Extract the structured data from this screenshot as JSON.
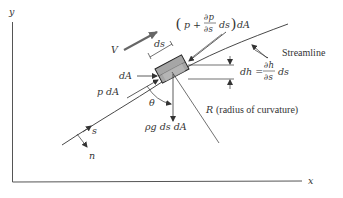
{
  "diagram": {
    "type": "free-body diagram of fluid element along a streamline",
    "axes": {
      "x_label": "x",
      "y_label": "y"
    },
    "labels": {
      "velocity": "V",
      "element_length": "ds",
      "area": "dA",
      "pressure_force_upstream": "p dA",
      "pressure_force_downstream_open": "(",
      "pressure_force_downstream_p": "p +",
      "pressure_force_downstream_num": "∂p",
      "pressure_force_downstream_den": "∂s",
      "pressure_force_downstream_ds": "ds",
      "pressure_force_downstream_close": ")",
      "pressure_force_downstream_dA": "dA",
      "height_change_lhs": "dh =",
      "height_change_num": "∂h",
      "height_change_den": "∂s",
      "height_change_ds": "ds",
      "streamline": "Streamline",
      "angle": "θ",
      "weight": "ρg ds dA",
      "radius": "R",
      "radius_text": "(radius of curvature)",
      "s_direction": "s",
      "n_direction": "n"
    },
    "colors": {
      "line": "#333333",
      "velocity_arrow": "#666666",
      "element_fill": "#a6a6a6",
      "element_stroke": "#222222",
      "axes": "#555555"
    }
  }
}
